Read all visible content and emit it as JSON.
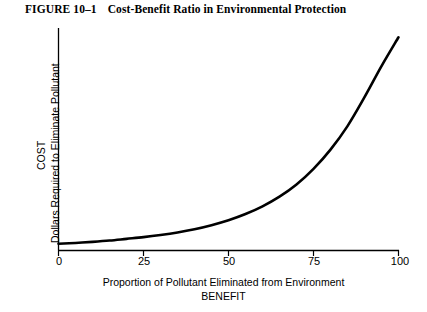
{
  "figure": {
    "number_label": "FIGURE 10–1",
    "title": "Cost-Benefit Ratio in Environmental Protection"
  },
  "chart_data": {
    "type": "line",
    "title": "Cost-Benefit Ratio in Environmental Protection",
    "xlabel": "Proportion of Pollutant Eliminated from Environment",
    "xlabel_line2": "BENEFIT",
    "ylabel": "COST",
    "ylabel_line2": "Dollars Required to Eliminate Pollutant",
    "xlim": [
      0,
      100
    ],
    "ylim": [
      0,
      100
    ],
    "xticks": [
      0,
      25,
      50,
      75,
      100
    ],
    "xtick_labels": [
      "0",
      "25",
      "50",
      "75",
      "100"
    ],
    "yticks": [],
    "ytick_labels": [],
    "grid": false,
    "legend": false,
    "series": [
      {
        "name": "Cost to eliminate pollutant",
        "color": "#000000",
        "linewidth": 2.6,
        "x": [
          0,
          5,
          10,
          15,
          20,
          25,
          30,
          35,
          40,
          45,
          50,
          55,
          60,
          65,
          70,
          75,
          80,
          85,
          90,
          95,
          100
        ],
        "y": [
          1.5,
          1.9,
          2.4,
          3.0,
          3.8,
          4.6,
          5.6,
          6.8,
          8.3,
          10.2,
          12.5,
          15.4,
          19.0,
          23.5,
          29.2,
          36.5,
          45.5,
          56.5,
          70.0,
          84.5,
          98.0
        ]
      }
    ],
    "annotations": []
  },
  "axes": {
    "x_axis_color": "#000000",
    "y_axis_color": "#000000",
    "tick_color": "#000000"
  }
}
